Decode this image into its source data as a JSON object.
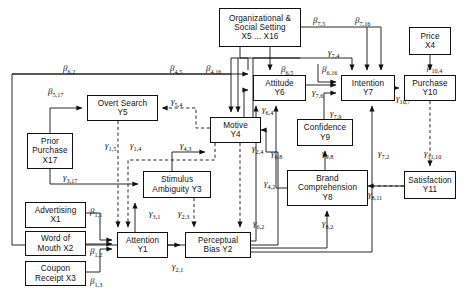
{
  "diagram": {
    "type": "path-diagram",
    "width": 465,
    "height": 301,
    "nodes": [
      {
        "id": "X5X16",
        "label_lines": [
          "Organizational &",
          "Social Setting",
          "X5 ... X16"
        ],
        "x": 219,
        "y": 8,
        "w": 82,
        "h": 39
      },
      {
        "id": "X4",
        "label_lines": [
          "Price",
          "X4"
        ],
        "x": 409,
        "y": 27,
        "w": 42,
        "h": 28
      },
      {
        "id": "Y5",
        "label_lines": [
          "Overt  Search",
          "Y5"
        ],
        "x": 87,
        "y": 95,
        "w": 71,
        "h": 26
      },
      {
        "id": "Y6",
        "label_lines": [
          "Attitude",
          "Y6"
        ],
        "x": 253,
        "y": 75,
        "w": 53,
        "h": 26
      },
      {
        "id": "Y7",
        "label_lines": [
          "Intention",
          "Y7"
        ],
        "x": 341,
        "y": 75,
        "w": 54,
        "h": 26
      },
      {
        "id": "Y10",
        "label_lines": [
          "Purchase",
          "Y10"
        ],
        "x": 404,
        "y": 75,
        "w": 52,
        "h": 26
      },
      {
        "id": "Y4",
        "label_lines": [
          "Motive",
          "Y4"
        ],
        "x": 210,
        "y": 117,
        "w": 51,
        "h": 26
      },
      {
        "id": "Y9",
        "label_lines": [
          "Confidence",
          "Y9"
        ],
        "x": 297,
        "y": 119,
        "w": 56,
        "h": 27
      },
      {
        "id": "X17",
        "label_lines": [
          "Prior",
          "Purchase",
          "X17"
        ],
        "x": 27,
        "y": 133,
        "w": 46,
        "h": 36
      },
      {
        "id": "Y3",
        "label_lines": [
          "Stimulus",
          "Ambiguity Y3"
        ],
        "x": 143,
        "y": 171,
        "w": 68,
        "h": 27
      },
      {
        "id": "Y8",
        "label_lines": [
          "Brand",
          "Comprehension",
          "Y8"
        ],
        "x": 287,
        "y": 170,
        "w": 81,
        "h": 36
      },
      {
        "id": "Y11",
        "label_lines": [
          "Satisfaction",
          "Y11"
        ],
        "x": 404,
        "y": 171,
        "w": 52,
        "h": 28
      },
      {
        "id": "X1",
        "label_lines": [
          "Advertising",
          "X1"
        ],
        "x": 25,
        "y": 202,
        "w": 61,
        "h": 26
      },
      {
        "id": "X2",
        "label_lines": [
          "Word of",
          "Mouth  X2"
        ],
        "x": 25,
        "y": 231,
        "w": 61,
        "h": 25
      },
      {
        "id": "Y1",
        "label_lines": [
          "Attention",
          "Y1"
        ],
        "x": 117,
        "y": 232,
        "w": 51,
        "h": 26
      },
      {
        "id": "Y2",
        "label_lines": [
          "Perceptual",
          "Bias  Y2"
        ],
        "x": 185,
        "y": 232,
        "w": 66,
        "h": 26
      },
      {
        "id": "X3",
        "label_lines": [
          "Coupon",
          "Receipt  X3"
        ],
        "x": 25,
        "y": 261,
        "w": 61,
        "h": 25
      }
    ],
    "path_labels": [
      {
        "id": "b62",
        "greek": "β",
        "sub": "6,2",
        "x": 63,
        "y": 63
      },
      {
        "id": "b517",
        "greek": "β",
        "sub": "5,17",
        "x": 48,
        "y": 86
      },
      {
        "id": "b45",
        "greek": "β",
        "sub": "4,5",
        "x": 170,
        "y": 63
      },
      {
        "id": "b416",
        "greek": "β",
        "sub": "4,16",
        "x": 206,
        "y": 63
      },
      {
        "id": "b75",
        "greek": "β",
        "sub": "7,5",
        "x": 313,
        "y": 15
      },
      {
        "id": "b716",
        "greek": "β",
        "sub": "7,16",
        "x": 355,
        "y": 15
      },
      {
        "id": "b65",
        "greek": "β",
        "sub": "6,5",
        "x": 281,
        "y": 64
      },
      {
        "id": "b616",
        "greek": "β",
        "sub": "6,16",
        "x": 322,
        "y": 64
      },
      {
        "id": "b104",
        "greek": "β",
        "sub": "10,4",
        "x": 427,
        "y": 62
      },
      {
        "id": "g54",
        "greek": "γ",
        "sub": "5,4",
        "x": 171,
        "y": 96
      },
      {
        "id": "g74",
        "greek": "γ",
        "sub": "7,4",
        "x": 328,
        "y": 47
      },
      {
        "id": "g76",
        "greek": "γ",
        "sub": "7,6",
        "x": 312,
        "y": 87
      },
      {
        "id": "g64",
        "greek": "γ",
        "sub": "6,4",
        "x": 262,
        "y": 104
      },
      {
        "id": "g107",
        "greek": "γ",
        "sub": "10,7",
        "x": 396,
        "y": 93
      },
      {
        "id": "g79",
        "greek": "γ",
        "sub": "7,9",
        "x": 330,
        "y": 108
      },
      {
        "id": "g15",
        "greek": "γ",
        "sub": "1,5",
        "x": 105,
        "y": 140
      },
      {
        "id": "g14",
        "greek": "γ",
        "sub": "1,4",
        "x": 130,
        "y": 140
      },
      {
        "id": "g43",
        "greek": "γ",
        "sub": "4,3",
        "x": 180,
        "y": 140
      },
      {
        "id": "g24",
        "greek": "γ",
        "sub": "2,4",
        "x": 252,
        "y": 143
      },
      {
        "id": "g68",
        "greek": "γ",
        "sub": "6,8",
        "x": 271,
        "y": 148
      },
      {
        "id": "g98",
        "greek": "γ",
        "sub": "9,8",
        "x": 322,
        "y": 148
      },
      {
        "id": "g72",
        "greek": "γ",
        "sub": "7,2",
        "x": 378,
        "y": 148
      },
      {
        "id": "g1110",
        "greek": "γ",
        "sub": "11,10",
        "x": 424,
        "y": 148
      },
      {
        "id": "b317",
        "greek": "γ",
        "sub": "3,17",
        "x": 63,
        "y": 172
      },
      {
        "id": "g42",
        "greek": "γ",
        "sub": "4,2",
        "x": 264,
        "y": 178
      },
      {
        "id": "g811",
        "greek": "γ",
        "sub": "8,11",
        "x": 368,
        "y": 189
      },
      {
        "id": "g31",
        "greek": "γ",
        "sub": "3,1",
        "x": 149,
        "y": 208
      },
      {
        "id": "g23",
        "greek": "γ",
        "sub": "2,3",
        "x": 178,
        "y": 208
      },
      {
        "id": "b11",
        "greek": "β",
        "sub": "1,1",
        "x": 90,
        "y": 206
      },
      {
        "id": "b12",
        "greek": "β",
        "sub": "1,2",
        "x": 90,
        "y": 246
      },
      {
        "id": "b13",
        "greek": "β",
        "sub": "1,3",
        "x": 90,
        "y": 276
      },
      {
        "id": "g62",
        "greek": "γ",
        "sub": "6,2",
        "x": 253,
        "y": 218
      },
      {
        "id": "g82",
        "greek": "γ",
        "sub": "8,2",
        "x": 322,
        "y": 218
      },
      {
        "id": "g21",
        "greek": "γ",
        "sub": "2,1",
        "x": 172,
        "y": 261
      }
    ]
  }
}
